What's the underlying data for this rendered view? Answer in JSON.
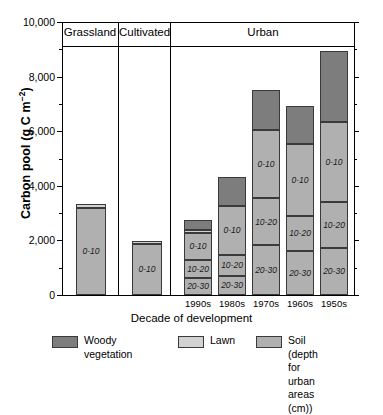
{
  "chart_data": {
    "type": "bar",
    "subtype": "stacked-bar-grouped-panels",
    "title": "",
    "xlabel": "Decade of development",
    "ylabel": "Carbon pool (g C m⁻²)",
    "ylim": [
      0,
      10000
    ],
    "ytick_labels": [
      "0",
      "2,000",
      "4,000",
      "6,000",
      "8,000",
      "10,000"
    ],
    "ytick_values": [
      0,
      2000,
      4000,
      6000,
      8000,
      10000
    ],
    "minor_tick_interval": 1000,
    "grid": false,
    "legend_position": "bottom",
    "panels": [
      {
        "label": "Grassland",
        "categories": [
          "Grassland"
        ]
      },
      {
        "label": "Cultivated",
        "categories": [
          "Cultivated"
        ]
      },
      {
        "label": "Urban",
        "categories": [
          "1990s",
          "1980s",
          "1970s",
          "1960s",
          "1950s"
        ]
      }
    ],
    "categories": [
      "Grassland",
      "Cultivated",
      "1990s",
      "1980s",
      "1970s",
      "1960s",
      "1950s"
    ],
    "series": [
      {
        "name": "Soil 20-30",
        "label": "20-30",
        "color": "#b0b0b0",
        "values": [
          0,
          0,
          620,
          700,
          1820,
          1610,
          1720
        ]
      },
      {
        "name": "Soil 10-20",
        "label": "10-20",
        "color": "#b0b0b0",
        "values": [
          0,
          0,
          650,
          760,
          1720,
          1280,
          1680
        ]
      },
      {
        "name": "Soil 0-10",
        "label": "0-10",
        "color": "#b0b0b0",
        "values": [
          3180,
          1860,
          1000,
          1810,
          2490,
          2640,
          2940
        ]
      },
      {
        "name": "Lawn",
        "label": "",
        "color": "#d2d2d2",
        "values": [
          140,
          130,
          110,
          0,
          0,
          0,
          0
        ]
      },
      {
        "name": "Woody vegetation",
        "label": "",
        "color": "#7d7d7d",
        "values": [
          0,
          0,
          360,
          1050,
          1470,
          1380,
          2590
        ]
      }
    ],
    "totals": [
      3320,
      1990,
      2740,
      4320,
      7500,
      6910,
      8930
    ],
    "bar_colors": {
      "woody": "#7d7d7d",
      "lawn": "#d2d2d2",
      "soil": "#b0b0b0",
      "outline": "#3a3a3a"
    }
  },
  "legend": {
    "items": [
      {
        "name": "woody-vegetation",
        "label": "Woody\nvegetation",
        "color": "#7d7d7d"
      },
      {
        "name": "lawn",
        "label": "Lawn",
        "color": "#d2d2d2"
      },
      {
        "name": "soil",
        "label": "Soil (depth for\n urban areas (cm))",
        "color": "#b0b0b0"
      }
    ]
  }
}
